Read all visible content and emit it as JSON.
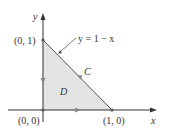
{
  "diagram": {
    "axes": {
      "x_label": "x",
      "y_label": "y"
    },
    "points": {
      "origin": "(0, 0)",
      "y_intercept": "(0, 1)",
      "x_intercept": "(1, 0)"
    },
    "curve_label": "y = 1 − x",
    "boundary_label": "C",
    "region_label": "D",
    "colors": {
      "region_fill": "#e3e3e3",
      "line": "#555555",
      "axis": "#333333",
      "arrow": "#888888"
    }
  }
}
